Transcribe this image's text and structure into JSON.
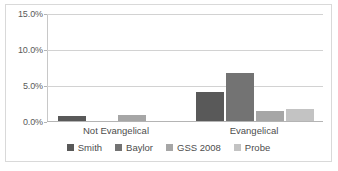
{
  "chart_data": {
    "type": "bar",
    "title": "",
    "xlabel": "",
    "ylabel": "",
    "categories": [
      "Not Evangelical",
      "Evangelical"
    ],
    "series": [
      {
        "name": "Smith",
        "color": "#595959",
        "values": [
          0.7,
          4.0
        ]
      },
      {
        "name": "Baylor",
        "color": "#737373",
        "values": [
          0.0,
          6.7
        ]
      },
      {
        "name": "GSS 2008",
        "color": "#a6a6a6",
        "values": [
          0.8,
          1.4
        ]
      },
      {
        "name": "Probe",
        "color": "#c3c3c3",
        "values": [
          0.0,
          1.7
        ]
      }
    ],
    "ylim": [
      0,
      15
    ],
    "ytick_labels": [
      "0.0%",
      "5.0%",
      "10.0%",
      "15.0%"
    ],
    "ytick_values": [
      0,
      5,
      10,
      15
    ],
    "grid": true,
    "legend_position": "bottom"
  },
  "axis": {
    "y_labels": {
      "t0": "0.0%",
      "t5": "5.0%",
      "t10": "10.0%",
      "t15": "15.0%"
    },
    "x_labels": {
      "c0": "Not Evangelical",
      "c1": "Evangelical"
    }
  },
  "legend": {
    "items": [
      {
        "label": "Smith"
      },
      {
        "label": "Baylor"
      },
      {
        "label": "GSS 2008"
      },
      {
        "label": "Probe"
      }
    ]
  }
}
